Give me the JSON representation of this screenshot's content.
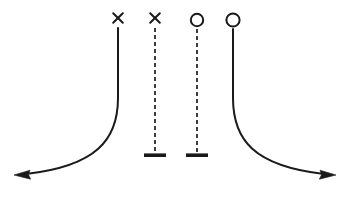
{
  "figure": {
    "title": "",
    "background_color": "#ffffff",
    "stroke_color": "#1a1a1a",
    "width": 350,
    "height": 202
  },
  "style": {
    "solid_curve_width": 2.0,
    "dashed_line_width": 1.6,
    "dash_pattern": "4,3",
    "marker_stroke_width": 2.0,
    "terminator_bar_width": 3.4
  },
  "baseline": {
    "label": "baseline",
    "y": 175
  },
  "curves": [
    {
      "name": "left-asymptotic-curve",
      "style": "solid",
      "marker": "cross",
      "marker_label": "×",
      "marker_x": 118,
      "marker_y": 18,
      "top_x": 118,
      "top_y": 28,
      "bend_y": 100,
      "end_x": 14,
      "end_y": 175,
      "arrow": "left",
      "path": "M 118 28 L 118 98 C 118 140 96 166 26 174"
    },
    {
      "name": "right-asymptotic-curve",
      "style": "solid",
      "marker": "circle",
      "marker_label": "○",
      "marker_x": 233,
      "marker_y": 20,
      "top_x": 233,
      "top_y": 29,
      "bend_y": 100,
      "end_x": 336,
      "end_y": 175,
      "arrow": "right",
      "path": "M 233 29 L 233 98 C 233 140 254 166 324 174"
    }
  ],
  "dashed_lines": [
    {
      "name": "inner-dashed-line-cross",
      "style": "dashed",
      "marker": "cross",
      "marker_label": "×",
      "marker_x": 155,
      "marker_y": 18,
      "top_y": 28,
      "bottom_y": 155,
      "terminator": "horizontal-bar",
      "bar_half_width": 11
    },
    {
      "name": "inner-dashed-line-circle",
      "style": "dashed",
      "marker": "circle",
      "marker_label": "○",
      "marker_x": 197,
      "marker_y": 20,
      "top_y": 29,
      "bottom_y": 155,
      "terminator": "horizontal-bar",
      "bar_half_width": 11
    }
  ],
  "markers": [
    {
      "name": "marker-1",
      "type": "cross",
      "glyph": "×",
      "x": 118,
      "y": 18,
      "size": 7.0
    },
    {
      "name": "marker-2",
      "type": "cross",
      "glyph": "×",
      "x": 155,
      "y": 18,
      "size": 7.0
    },
    {
      "name": "marker-3",
      "type": "circle",
      "glyph": "○",
      "x": 197,
      "y": 20,
      "radius": 6.2
    },
    {
      "name": "marker-4",
      "type": "circle",
      "glyph": "○",
      "x": 233,
      "y": 20,
      "radius": 6.6
    }
  ],
  "arrowheads": [
    {
      "name": "left-arrowhead",
      "direction": "left",
      "tip_x": 14,
      "tip_y": 175
    },
    {
      "name": "right-arrowhead",
      "direction": "right",
      "tip_x": 336,
      "tip_y": 175
    }
  ]
}
